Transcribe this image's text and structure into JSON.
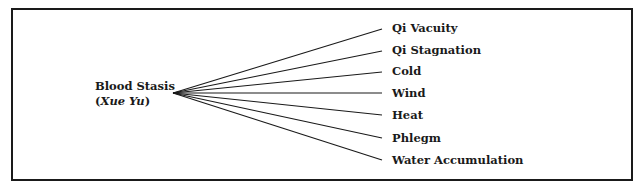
{
  "diagram": {
    "source": {
      "line1": "Blood Stasis",
      "paren_open": "(",
      "italic": "Xue Yu",
      "paren_close": ")"
    },
    "targets": [
      {
        "label": "Qi Vacuity",
        "y": 29
      },
      {
        "label": "Qi Stagnation",
        "y": 51
      },
      {
        "label": "Cold",
        "y": 72
      },
      {
        "label": "Wind",
        "y": 93
      },
      {
        "label": "Heat",
        "y": 115
      },
      {
        "label": "Phlegm",
        "y": 138
      },
      {
        "label": "Water Accumulation",
        "y": 160
      }
    ],
    "line_color": "#1a1a1a"
  }
}
